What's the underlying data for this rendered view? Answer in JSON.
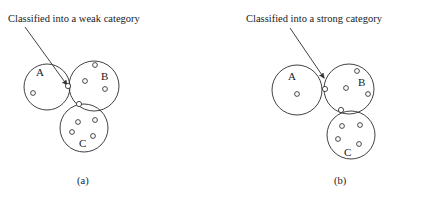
{
  "figure": {
    "background": "#ffffff",
    "stroke_color": "#2b2b2b",
    "text_color": "#1a1a1a",
    "width": 437,
    "height": 199
  },
  "panels": [
    {
      "id": "a",
      "caption": "(a)",
      "caption_pos": {
        "x": 77,
        "y": 184
      },
      "annotation": {
        "text": "Classified into a weak category",
        "x": 8,
        "y": 22,
        "arrow": {
          "x1": 25,
          "y1": 27,
          "x2": 67,
          "y2": 85
        }
      },
      "clusters": [
        {
          "label": "A",
          "label_pos": {
            "x": 36,
            "y": 76
          },
          "circle": {
            "cx": 47,
            "cy": 87,
            "r": 23
          },
          "points": [
            {
              "cx": 33,
              "cy": 93,
              "r": 2.4
            }
          ]
        },
        {
          "label": "B",
          "label_pos": {
            "x": 101,
            "y": 80
          },
          "circle": {
            "cx": 94,
            "cy": 86,
            "r": 25
          },
          "points": [
            {
              "cx": 95,
              "cy": 65,
              "r": 2.4
            },
            {
              "cx": 85,
              "cy": 81,
              "r": 2.4
            },
            {
              "cx": 105,
              "cy": 89,
              "r": 2.4
            }
          ]
        },
        {
          "label": "C",
          "label_pos": {
            "x": 79,
            "y": 147
          },
          "circle": {
            "cx": 84,
            "cy": 128,
            "r": 24
          },
          "points": [
            {
              "cx": 78,
              "cy": 122,
              "r": 2.4
            },
            {
              "cx": 95,
              "cy": 120,
              "r": 2.4
            },
            {
              "cx": 72,
              "cy": 132,
              "r": 2.4
            },
            {
              "cx": 93,
              "cy": 136,
              "r": 2.4
            }
          ]
        }
      ],
      "boundary_points": [
        {
          "cx": 68,
          "cy": 86,
          "r": 2.6,
          "name": "weak-boundary-point-ab"
        },
        {
          "cx": 79,
          "cy": 104,
          "r": 2.6,
          "name": "weak-boundary-point-bc"
        }
      ]
    },
    {
      "id": "b",
      "caption": "(b)",
      "caption_pos": {
        "x": 334,
        "y": 184
      },
      "annotation": {
        "text": "Classified into a strong category",
        "x": 246,
        "y": 22,
        "arrow": {
          "x1": 290,
          "y1": 28,
          "x2": 324,
          "y2": 78
        }
      },
      "clusters": [
        {
          "label": "A",
          "label_pos": {
            "x": 288,
            "y": 80
          },
          "circle": {
            "cx": 297,
            "cy": 90,
            "r": 25
          },
          "points": [
            {
              "cx": 297,
              "cy": 94,
              "r": 2.4
            }
          ]
        },
        {
          "label": "B",
          "label_pos": {
            "x": 358,
            "y": 86
          },
          "circle": {
            "cx": 349,
            "cy": 89,
            "r": 25
          },
          "points": [
            {
              "cx": 357,
              "cy": 71,
              "r": 2.4
            },
            {
              "cx": 346,
              "cy": 88,
              "r": 2.4
            },
            {
              "cx": 368,
              "cy": 94,
              "r": 2.4
            }
          ]
        },
        {
          "label": "C",
          "label_pos": {
            "x": 344,
            "y": 156
          },
          "circle": {
            "cx": 351,
            "cy": 135,
            "r": 24
          },
          "points": [
            {
              "cx": 342,
              "cy": 126,
              "r": 2.4
            },
            {
              "cx": 360,
              "cy": 125,
              "r": 2.4
            },
            {
              "cx": 338,
              "cy": 139,
              "r": 2.4
            },
            {
              "cx": 359,
              "cy": 144,
              "r": 2.4
            }
          ]
        }
      ],
      "boundary_points": [
        {
          "cx": 325,
          "cy": 89,
          "r": 2.6,
          "name": "strong-boundary-point-ab"
        },
        {
          "cx": 341,
          "cy": 110,
          "r": 2.6,
          "name": "strong-boundary-point-bc"
        }
      ]
    }
  ]
}
